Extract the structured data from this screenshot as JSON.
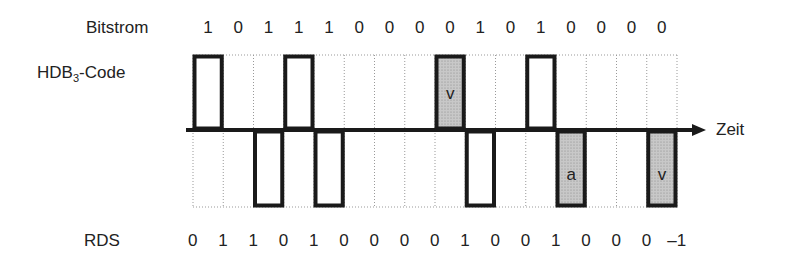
{
  "labels": {
    "bitstream": "Bitstrom",
    "code_main": "HDB",
    "code_sub": "3",
    "code_suffix": "-Code",
    "time": "Zeit",
    "rds": "RDS"
  },
  "bits": [
    "1",
    "0",
    "1",
    "1",
    "1",
    "0",
    "0",
    "0",
    "0",
    "1",
    "0",
    "1",
    "0",
    "0",
    "0",
    "0"
  ],
  "levels": [
    1,
    0,
    -1,
    1,
    -1,
    0,
    0,
    0,
    1,
    -1,
    0,
    1,
    -1,
    0,
    0,
    -1
  ],
  "marks": [
    "",
    "",
    "",
    "",
    "",
    "",
    "",
    "",
    "v",
    "",
    "",
    "",
    "a",
    "",
    "",
    "v"
  ],
  "rds": [
    "0",
    "1",
    "1",
    "0",
    "1",
    "0",
    "0",
    "0",
    "0",
    "1",
    "0",
    "0",
    "1",
    "0",
    "0",
    "0",
    "–1"
  ],
  "colors": {
    "line": "#1a1a1a",
    "fill": "#c8c8c8",
    "grid": "#999999"
  }
}
